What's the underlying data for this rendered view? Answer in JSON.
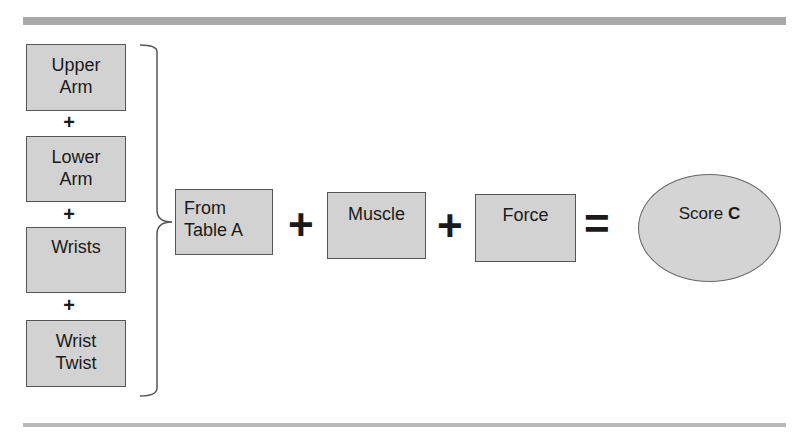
{
  "diagram": {
    "inputs": [
      {
        "line1": "Upper",
        "line2": "Arm"
      },
      {
        "line1": "Lower",
        "line2": "Arm"
      },
      {
        "line1": "Wrists",
        "line2": ""
      },
      {
        "line1": "Wrist",
        "line2": "Twist"
      }
    ],
    "plus_symbol": "+",
    "equals_symbol": "=",
    "table_box": {
      "line1": "From",
      "line2": "Table A"
    },
    "muscle_box": {
      "label": "Muscle"
    },
    "force_box": {
      "label": "Force"
    },
    "result": {
      "prefix": "Score ",
      "letter": "C"
    }
  },
  "colors": {
    "box_fill": "#d2d2d2",
    "border": "#555555",
    "rule": "#a8a8a8"
  }
}
